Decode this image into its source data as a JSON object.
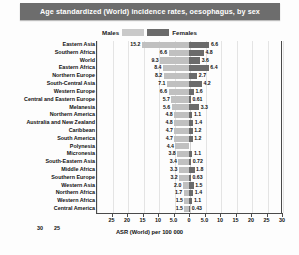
{
  "title": "Age standardized (World) incidence rates, oesophagus, by sex",
  "legend": {
    "males_label": "Males",
    "females_label": "Females",
    "male_color": "#c0c0c0",
    "female_color": "#6b6b6b"
  },
  "axis": {
    "title": "ASR (World) per 100 000",
    "ticks": [
      "25",
      "20",
      "15",
      "10",
      "5.0",
      "0",
      "5.0",
      "10",
      "15",
      "20",
      "25",
      "30"
    ],
    "extra_ticks": [
      "30",
      "25"
    ]
  },
  "chart_data": {
    "type": "bar",
    "subtype": "diverging-horizontal-tornado",
    "title": "Age standardized (World) incidence rates, oesophagus, by sex",
    "xlabel": "ASR (World) per 100 000",
    "ylabel": "",
    "xlim": [
      -30,
      30
    ],
    "grid": true,
    "legend_position": "top-center",
    "categories": [
      "Eastern Asia",
      "Southern Africa",
      "World",
      "Eastern Africa",
      "Northern Europe",
      "South-Central Asia",
      "Western Europe",
      "Central and Eastern Europe",
      "Melanesia",
      "Northern America",
      "Australia and New Zealand",
      "Caribbean",
      "South America",
      "Polynesia",
      "Micronesia",
      "South-Eastern Asia",
      "Middle Africa",
      "Southern Europe",
      "Western Asia",
      "Northern Africa",
      "Western Africa",
      "Central America"
    ],
    "series": [
      {
        "name": "Males",
        "direction": "left",
        "color": "#c0c0c0",
        "values": [
          15.2,
          6.6,
          9.3,
          8.4,
          8.2,
          7.1,
          6.6,
          5.7,
          5.6,
          4.8,
          4.8,
          4.7,
          4.7,
          4.4,
          3.8,
          3.4,
          3.3,
          3.2,
          2.0,
          1.7,
          1.5,
          1.5
        ],
        "labels": [
          "15.2",
          "6.6",
          "9.3",
          "8.4",
          "8.2",
          "7.1",
          "6.6",
          "5.7",
          "5.6",
          "4.8",
          "4.8",
          "4.7",
          "4.7",
          "4.4",
          "3.8",
          "3.4",
          "3.3",
          "3.2",
          "2.0",
          "1.7",
          "1.5",
          "1.5"
        ]
      },
      {
        "name": "Females",
        "direction": "right",
        "color": "#6b6b6b",
        "values": [
          6.6,
          4.8,
          3.6,
          6.4,
          2.7,
          4.2,
          1.6,
          0.61,
          3.3,
          1.1,
          1.4,
          1.2,
          1.2,
          null,
          1.1,
          0.72,
          1.8,
          0.63,
          1.5,
          1.4,
          1.1,
          0.43
        ],
        "labels": [
          "6.6",
          "4.8",
          "3.6",
          "6.4",
          "2.7",
          "4.2",
          "1.6",
          "0.61",
          "3.3",
          "1.1",
          "1.4",
          "1.2",
          "1.2",
          "",
          "1.1",
          "0.72",
          "1.8",
          "0.63",
          "1.5",
          "1.4",
          "1.1",
          "0.43"
        ]
      }
    ]
  }
}
